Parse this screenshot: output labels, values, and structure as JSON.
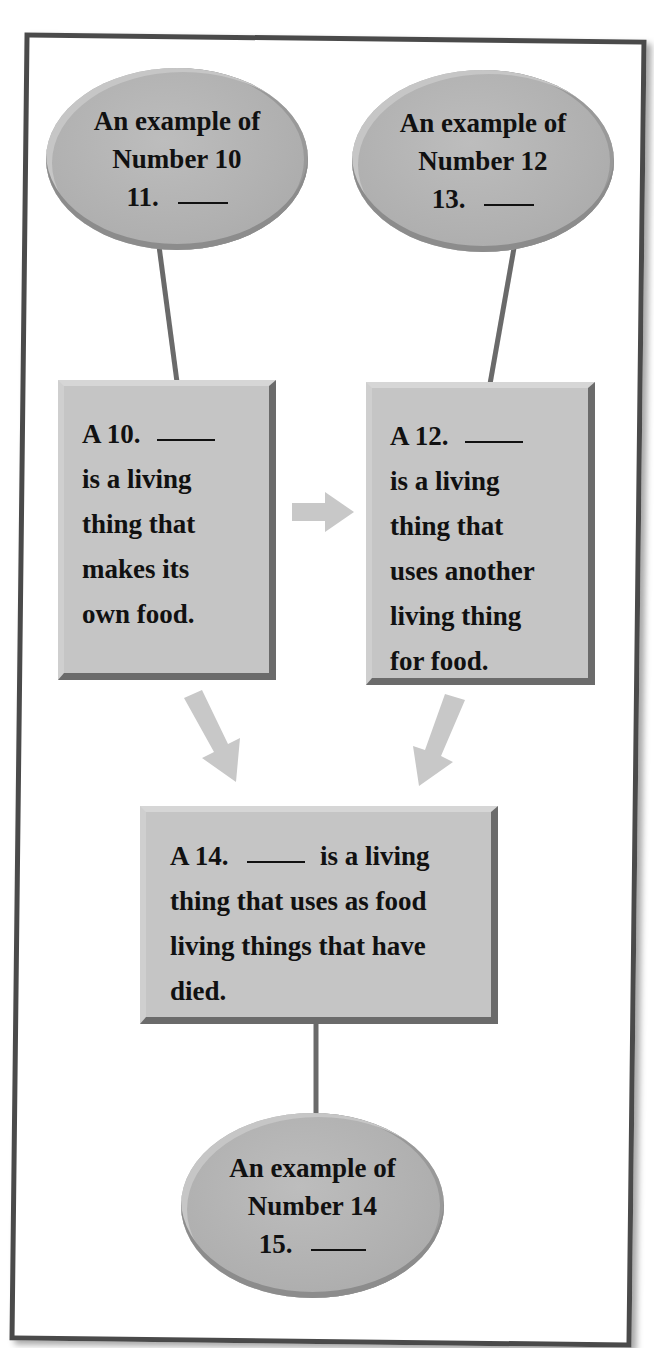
{
  "diagram": {
    "ellipses": [
      {
        "id": "example-producer",
        "lines": [
          "An example of",
          "Number 10",
          "11."
        ],
        "blank": "____"
      },
      {
        "id": "example-consumer",
        "lines": [
          "An example of",
          "Number 12",
          "13."
        ],
        "blank": "____"
      },
      {
        "id": "example-decomposer",
        "lines": [
          "An example of",
          "Number 14",
          "15."
        ],
        "blank": "____"
      }
    ],
    "boxes": [
      {
        "id": "box-10",
        "prefix": "A  10.",
        "blank": "____",
        "lines": [
          "is a living",
          "thing that",
          "makes its",
          "own food."
        ]
      },
      {
        "id": "box-12",
        "prefix": "A  12.",
        "blank": "____",
        "lines": [
          "is a living",
          "thing that",
          "uses another",
          "living thing",
          "for food."
        ]
      },
      {
        "id": "box-14",
        "prefix": "A  14.",
        "blank": "____",
        "first_suffix": "is a living",
        "lines": [
          "thing that uses as food",
          "living things that have",
          "died."
        ]
      }
    ],
    "colors": {
      "frame_border": "#4a4a4a",
      "ellipse_fill": "#b3b3b3",
      "box_fill": "#c5c5c5",
      "bevel_dark": "#6b6b6b",
      "connector": "#6a6a6a",
      "arrow": "#c8c8c8"
    }
  }
}
